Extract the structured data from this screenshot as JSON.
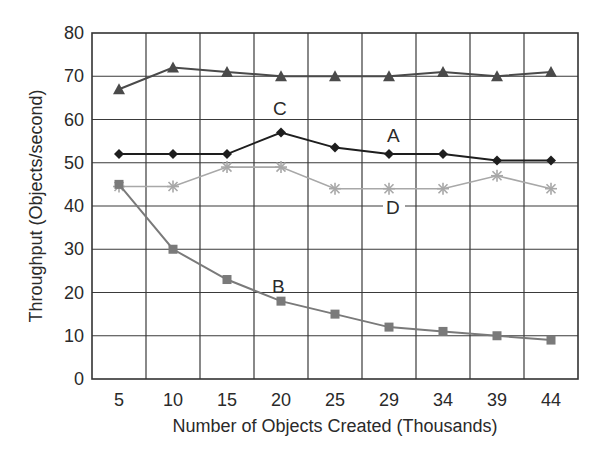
{
  "chart_data": {
    "type": "line",
    "title": "",
    "xlabel": "Number of Objects Created (Thousands)",
    "ylabel": "Throughput (Objects/second)",
    "categories": [
      "5",
      "10",
      "15",
      "20",
      "25",
      "29",
      "34",
      "39",
      "44"
    ],
    "ylim": [
      0,
      80
    ],
    "yticks": [
      0,
      10,
      20,
      30,
      40,
      50,
      60,
      70,
      80
    ],
    "grid": true,
    "legend": "inline labels",
    "series": [
      {
        "name": "C",
        "marker": "triangle",
        "color": "#4a4a4a",
        "values": [
          67,
          72,
          71,
          70,
          70,
          70,
          71,
          70,
          71
        ],
        "label_pos": {
          "cat_index": 3,
          "dx": -8,
          "value": 62.7
        }
      },
      {
        "name": "A",
        "marker": "diamond",
        "color": "#1e1e1e",
        "values": [
          52,
          52,
          52,
          57,
          53.5,
          52,
          52,
          50.5,
          50.5
        ],
        "label_pos": {
          "cat_index": 5,
          "dx": -2,
          "value": 56.5
        }
      },
      {
        "name": "D",
        "marker": "asterisk",
        "color": "#a8a8a8",
        "values": [
          44.5,
          44.5,
          49,
          49,
          44,
          44,
          44,
          47,
          44
        ],
        "label_pos": {
          "cat_index": 5,
          "dx": -3,
          "value": 39.8
        }
      },
      {
        "name": "B",
        "marker": "square",
        "color": "#7a7a7a",
        "values": [
          45,
          30,
          23,
          18,
          15,
          12,
          11,
          10,
          9
        ],
        "label_pos": {
          "cat_index": 3,
          "dx": -9,
          "value": 21.6
        }
      }
    ]
  },
  "colors": {
    "axis": "#333333",
    "grid": "#3a3a3a",
    "text": "#2a2a2a",
    "background": "#ffffff"
  }
}
